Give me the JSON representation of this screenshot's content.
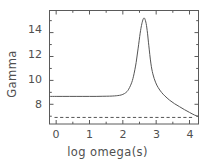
{
  "chart_data": {
    "type": "line",
    "title": "",
    "xlabel": "log omega(s)",
    "ylabel": "Gamma",
    "xlim": [
      -0.2,
      4.27
    ],
    "ylim": [
      6.35,
      15.85
    ],
    "xticks": [
      0,
      1,
      2,
      3,
      4
    ],
    "xticklabels": [
      "0",
      "1",
      "2",
      "3",
      "4"
    ],
    "yticks": [
      8,
      10,
      12,
      14
    ],
    "yticklabels": [
      "8",
      "10",
      "12",
      "14"
    ],
    "grid": false,
    "legend": null,
    "frame": "box",
    "series": [
      {
        "name": "Gamma",
        "style": "solid",
        "color": "#555555",
        "x": [
          -0.2,
          0.0,
          0.2,
          0.4,
          0.6,
          0.8,
          1.0,
          1.2,
          1.4,
          1.6,
          1.75,
          1.85,
          1.95,
          2.05,
          2.15,
          2.25,
          2.32,
          2.4,
          2.46,
          2.52,
          2.56,
          2.6,
          2.63,
          2.66,
          2.7,
          2.74,
          2.78,
          2.84,
          2.9,
          2.98,
          3.06,
          3.16,
          3.26,
          3.4,
          3.55,
          3.7,
          3.85,
          4.0,
          4.15,
          4.27
        ],
        "y": [
          8.66,
          8.66,
          8.66,
          8.66,
          8.66,
          8.66,
          8.66,
          8.66,
          8.67,
          8.68,
          8.7,
          8.73,
          8.78,
          8.9,
          9.15,
          9.7,
          10.35,
          11.5,
          12.7,
          13.95,
          14.6,
          15.05,
          15.22,
          15.15,
          14.75,
          13.95,
          12.9,
          11.45,
          10.55,
          9.85,
          9.4,
          9.0,
          8.7,
          8.35,
          8.05,
          7.8,
          7.55,
          7.32,
          7.1,
          6.98
        ]
      },
      {
        "name": "baseline",
        "style": "dashed",
        "color": "#555555",
        "x": [
          -0.05,
          4.15
        ],
        "y": [
          6.9,
          6.9
        ]
      }
    ]
  },
  "axes": {
    "y_title": "Gamma",
    "x_title": "log omega(s)"
  }
}
